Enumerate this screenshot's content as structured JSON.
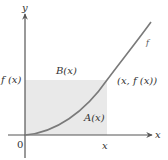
{
  "diagram": {
    "colors": {
      "shade": "#e9e9e9",
      "axis": "#555555",
      "curve": "#777777",
      "text": "#333333"
    },
    "labels": {
      "y_axis": "y",
      "x_axis": "x",
      "origin": "0",
      "x_tick": "x",
      "f_of_x_tick": "f (x)",
      "region_above": "B(x)",
      "region_below": "A(x)",
      "point": "(x, f (x))",
      "curve_name": "f"
    },
    "curve": {
      "type": "increasing convex",
      "passes_through": [
        "origin",
        "(x, f(x))"
      ]
    }
  }
}
